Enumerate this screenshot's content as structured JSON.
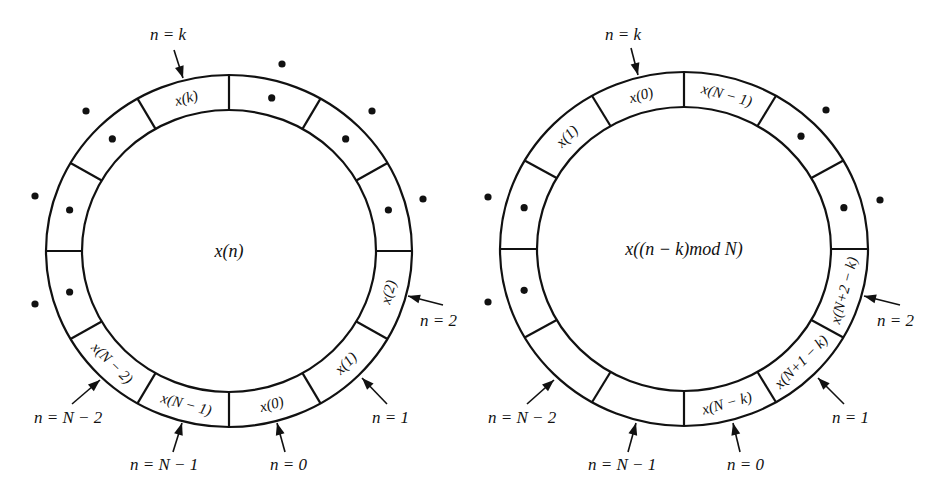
{
  "diagrams": [
    {
      "id": "original",
      "center": [
        229,
        251
      ],
      "rx_outer": 183,
      "ry_outer": 176,
      "rx_inner": 147,
      "ry_inner": 141,
      "center_label": "x(n)",
      "segments": [
        {
          "angle": 105,
          "label": "x(k)",
          "dot": false
        },
        {
          "angle": 75,
          "label": "",
          "dot": true
        },
        {
          "angle": 45,
          "label": "",
          "dot": true
        },
        {
          "angle": 15,
          "label": "",
          "dot": true
        },
        {
          "angle": -15,
          "label": "x(2)",
          "dot": false
        },
        {
          "angle": -45,
          "label": "x(1)",
          "dot": false
        },
        {
          "angle": -75,
          "label": "x(0)",
          "dot": false
        },
        {
          "angle": -105,
          "label": "x(N − 1)",
          "dot": false
        },
        {
          "angle": -135,
          "label": "x(N − 2)",
          "dot": false
        },
        {
          "angle": -165,
          "label": "",
          "dot": true
        },
        {
          "angle": 165,
          "label": "",
          "dot": true
        },
        {
          "angle": 135,
          "label": "",
          "dot": true
        }
      ],
      "outer_dots": [
        [
          282,
          64
        ],
        [
          372,
          111
        ],
        [
          423,
          199
        ],
        [
          35,
          196
        ],
        [
          86,
          111
        ],
        [
          35,
          304
        ]
      ],
      "pointers": [
        {
          "label": "n = k",
          "text_pos": [
            150,
            40
          ],
          "from": [
            174,
            50
          ],
          "to": [
            183,
            78
          ]
        },
        {
          "label": "n = 2",
          "text_pos": [
            420,
            326
          ],
          "from": [
            443,
            305
          ],
          "to": [
            408,
            296
          ]
        },
        {
          "label": "n = 1",
          "text_pos": [
            372,
            423
          ],
          "from": [
            387,
            404
          ],
          "to": [
            362,
            378
          ]
        },
        {
          "label": "n = 0",
          "text_pos": [
            270,
            470
          ],
          "from": [
            285,
            452
          ],
          "to": [
            277,
            423
          ]
        },
        {
          "label": "n = N − 1",
          "text_pos": [
            130,
            470
          ],
          "from": [
            173,
            452
          ],
          "to": [
            182,
            423
          ]
        },
        {
          "label": "n = N − 2",
          "text_pos": [
            34,
            423
          ],
          "from": [
            72,
            404
          ],
          "to": [
            100,
            380
          ]
        }
      ]
    },
    {
      "id": "shifted",
      "center": [
        684,
        249
      ],
      "rx_outer": 184,
      "ry_outer": 177,
      "rx_inner": 147,
      "ry_inner": 142,
      "center_label": "x((n − k)mod N)",
      "segments": [
        {
          "angle": 105,
          "label": "x(0)",
          "dot": false
        },
        {
          "angle": 75,
          "label": "x(N − 1)",
          "dot": false
        },
        {
          "angle": 45,
          "label": "",
          "dot": true
        },
        {
          "angle": 15,
          "label": "",
          "dot": true
        },
        {
          "angle": -15,
          "label": "x(N+2 − k)",
          "dot": false
        },
        {
          "angle": -45,
          "label": "x(N+1 − k)",
          "dot": false
        },
        {
          "angle": -75,
          "label": "x(N − k)",
          "dot": false
        },
        {
          "angle": -105,
          "label": "",
          "dot": false
        },
        {
          "angle": -135,
          "label": "",
          "dot": false
        },
        {
          "angle": -165,
          "label": "",
          "dot": true
        },
        {
          "angle": 165,
          "label": "",
          "dot": true
        },
        {
          "angle": 135,
          "label": "x(1)",
          "dot": false
        }
      ],
      "outer_dots": [
        [
          826,
          110
        ],
        [
          880,
          200
        ],
        [
          488,
          197
        ],
        [
          488,
          302
        ]
      ],
      "pointers": [
        {
          "label": "n = k",
          "text_pos": [
            605,
            40
          ],
          "from": [
            631,
            48
          ],
          "to": [
            638,
            75
          ]
        },
        {
          "label": "n = 2",
          "text_pos": [
            877,
            326
          ],
          "from": [
            900,
            305
          ],
          "to": [
            864,
            296
          ]
        },
        {
          "label": "n = 1",
          "text_pos": [
            832,
            423
          ],
          "from": [
            844,
            404
          ],
          "to": [
            818,
            378
          ]
        },
        {
          "label": "n = 0",
          "text_pos": [
            727,
            470
          ],
          "from": [
            740,
            452
          ],
          "to": [
            733,
            423
          ]
        },
        {
          "label": "n = N − 1",
          "text_pos": [
            588,
            470
          ],
          "from": [
            628,
            452
          ],
          "to": [
            636,
            423
          ]
        },
        {
          "label": "n = N − 2",
          "text_pos": [
            488,
            423
          ],
          "from": [
            527,
            404
          ],
          "to": [
            554,
            380
          ]
        }
      ]
    }
  ]
}
